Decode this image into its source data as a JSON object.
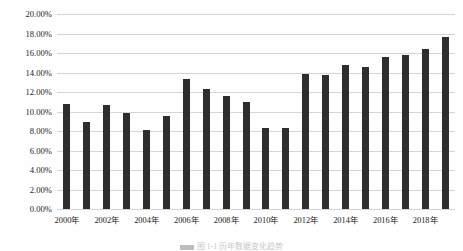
{
  "chart_data": {
    "type": "bar",
    "title": "",
    "subtitle": "",
    "xlabel": "",
    "ylabel": "",
    "ylim": [
      0,
      20
    ],
    "ytick_labels": [
      "0.00%",
      "2.00%",
      "4.00%",
      "6.00%",
      "8.00%",
      "10.00%",
      "12.00%",
      "14.00%",
      "16.00%",
      "18.00%",
      "20.00%"
    ],
    "ytick_values": [
      0,
      2,
      4,
      6,
      8,
      10,
      12,
      14,
      16,
      18,
      20
    ],
    "grid": true,
    "legend": "none",
    "bar_color": "#2e2e2e",
    "gridline_color": "#d4d4d4",
    "categories": [
      "2000年",
      "2001年",
      "2002年",
      "2003年",
      "2004年",
      "2005年",
      "2006年",
      "2007年",
      "2008年",
      "2009年",
      "2010年",
      "2011年",
      "2012年",
      "2013年",
      "2014年",
      "2015年",
      "2016年",
      "2017年",
      "2018年",
      "2019年"
    ],
    "visible_xtick_labels": [
      "2000年",
      "2002年",
      "2004年",
      "2006年",
      "2008年",
      "2010年",
      "2012年",
      "2014年",
      "2016年",
      "2018年"
    ],
    "visible_xtick_indices": [
      0,
      2,
      4,
      6,
      8,
      10,
      12,
      14,
      16,
      18
    ],
    "values": [
      10.8,
      8.9,
      10.7,
      9.8,
      8.1,
      9.5,
      13.3,
      12.3,
      11.6,
      11.0,
      8.3,
      8.3,
      13.8,
      13.75,
      14.8,
      14.6,
      15.55,
      15.75,
      16.45,
      17.6
    ]
  },
  "caption": {
    "text": "图 1-1 历年数据变化趋势"
  }
}
